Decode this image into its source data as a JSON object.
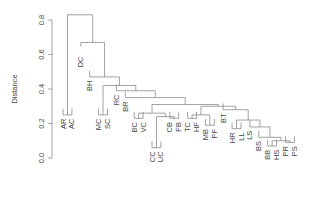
{
  "chart_data": {
    "type": "dendrogram",
    "title": "",
    "xlabel": "",
    "ylabel": "Distance",
    "ylim": [
      0,
      0.8
    ],
    "yticks": [
      0.0,
      0.2,
      0.4,
      0.6,
      0.8
    ],
    "ytick_labels": [
      "0.0",
      "0.2",
      "0.4",
      "0.6",
      "0.8"
    ],
    "leaves": [
      "AR",
      "AC",
      "DC",
      "BH",
      "MC",
      "SC",
      "RC",
      "BR",
      "BC",
      "VC",
      "CC",
      "UC",
      "CB",
      "FB",
      "TC",
      "HF",
      "MB",
      "PF",
      "BT",
      "HR",
      "LL",
      "LS",
      "BS",
      "BB",
      "HS",
      "PR",
      "PS"
    ],
    "leaf_heights": [
      0.24,
      0.24,
      0.6,
      0.46,
      0.24,
      0.24,
      0.38,
      0.34,
      0.22,
      0.22,
      0.05,
      0.05,
      0.22,
      0.22,
      0.22,
      0.22,
      0.18,
      0.18,
      0.27,
      0.16,
      0.16,
      0.17,
      0.11,
      0.06,
      0.06,
      0.08,
      0.08
    ],
    "merges": [
      {
        "id": "n1",
        "left": "AR",
        "right": "AC",
        "height": 0.25
      },
      {
        "id": "n2",
        "left": "MC",
        "right": "SC",
        "height": 0.25
      },
      {
        "id": "n3",
        "left": "BC",
        "right": "VC",
        "height": 0.23
      },
      {
        "id": "n4",
        "left": "CC",
        "right": "UC",
        "height": 0.06
      },
      {
        "id": "n5",
        "left": "CB",
        "right": "FB",
        "height": 0.23
      },
      {
        "id": "n6",
        "left": "TC",
        "right": "HF",
        "height": 0.23
      },
      {
        "id": "n7",
        "left": "MB",
        "right": "PF",
        "height": 0.19
      },
      {
        "id": "n8",
        "left": "HR",
        "right": "LL",
        "height": 0.17
      },
      {
        "id": "n9",
        "left": "BB",
        "right": "HS",
        "height": 0.07
      },
      {
        "id": "n10",
        "left": "PR",
        "right": "PS",
        "height": 0.09
      },
      {
        "id": "n11",
        "left": "n9",
        "right": "n10",
        "height": 0.1
      },
      {
        "id": "n12",
        "left": "BS",
        "right": "n11",
        "height": 0.12
      },
      {
        "id": "n13",
        "left": "LS",
        "right": "n12",
        "height": 0.18
      },
      {
        "id": "n14",
        "left": "n8",
        "right": "n13",
        "height": 0.22
      },
      {
        "id": "n15",
        "left": "BT",
        "right": "n14",
        "height": 0.28
      },
      {
        "id": "n16",
        "left": "n4",
        "right": "n5",
        "height": 0.24
      },
      {
        "id": "n17",
        "left": "n3",
        "right": "n16",
        "height": 0.26
      },
      {
        "id": "n18",
        "left": "n6",
        "right": "n7",
        "height": 0.25
      },
      {
        "id": "n19",
        "left": "n18",
        "right": "n15",
        "height": 0.3
      },
      {
        "id": "n20",
        "left": "n17",
        "right": "n19",
        "height": 0.31
      },
      {
        "id": "n21",
        "left": "BR",
        "right": "n20",
        "height": 0.35
      },
      {
        "id": "n22",
        "left": "RC",
        "right": "n21",
        "height": 0.39
      },
      {
        "id": "n23",
        "left": "n2",
        "right": "n22",
        "height": 0.42
      },
      {
        "id": "n24",
        "left": "BH",
        "right": "n23",
        "height": 0.47
      },
      {
        "id": "n25",
        "left": "DC",
        "right": "n24",
        "height": 0.67
      },
      {
        "id": "n26",
        "left": "n1",
        "right": "n25",
        "height": 0.83
      }
    ]
  },
  "layout": {
    "axis_x": 52,
    "y_at_zero": 158,
    "y_at_08": 20,
    "leaf_x_start": 63,
    "leaf_x_step": 8.9,
    "line_color": "#8a8a8a"
  }
}
